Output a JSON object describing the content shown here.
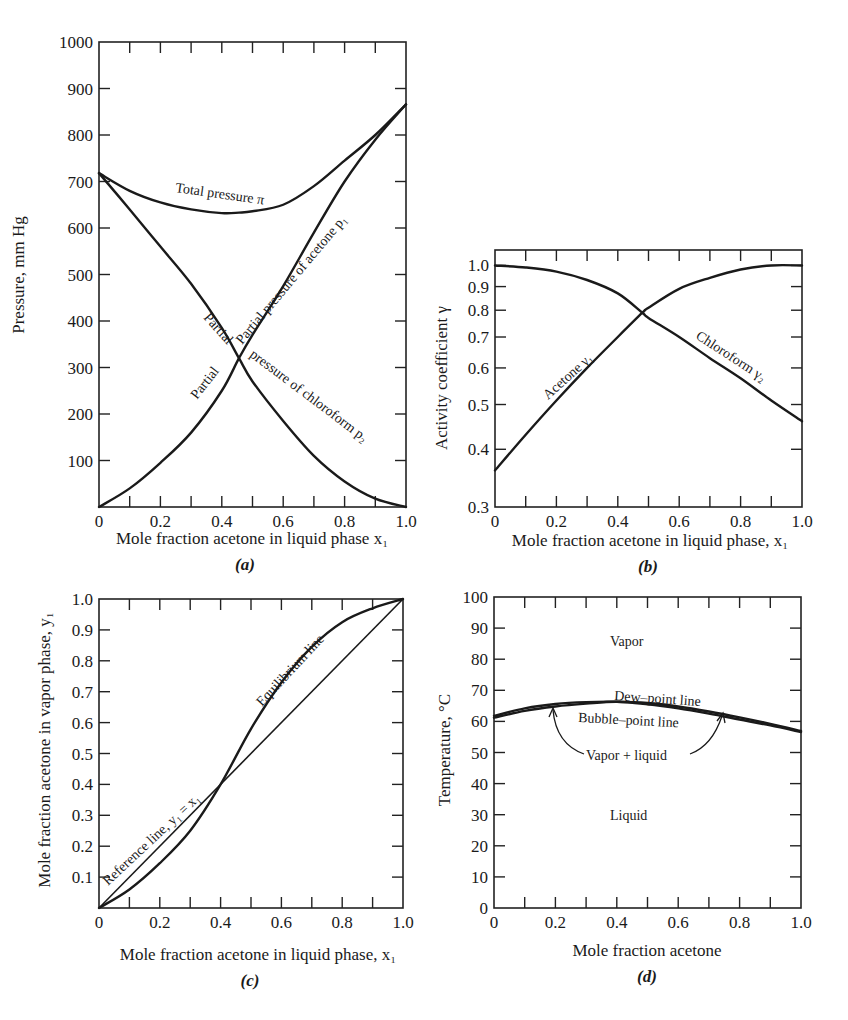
{
  "chart_data": [
    {
      "panel": "(a)",
      "type": "line",
      "title": "",
      "xlabel": "Mole fraction acetone in liquid phase x1",
      "ylabel": "Pressure, mm Hg",
      "xlim": [
        0,
        1.0
      ],
      "ylim": [
        0,
        1000
      ],
      "xticks": [
        "0",
        "0.2",
        "0.4",
        "0.6",
        "0.8",
        "1.0"
      ],
      "yticks": [
        "100",
        "200",
        "300",
        "400",
        "500",
        "600",
        "700",
        "800",
        "900",
        "1000"
      ],
      "grid": false,
      "x": [
        0,
        0.1,
        0.2,
        0.3,
        0.4,
        0.456,
        0.5,
        0.6,
        0.7,
        0.8,
        0.9,
        1.0
      ],
      "series": [
        {
          "name": "Total pressure π",
          "values": [
            718,
            680,
            655,
            640,
            632,
            633,
            636,
            650,
            690,
            745,
            800,
            866
          ]
        },
        {
          "name": "Partial pressure of acetone p1",
          "values": [
            0,
            40,
            95,
            160,
            250,
            320,
            370,
            475,
            590,
            700,
            790,
            866
          ]
        },
        {
          "name": "Partial pressure of chloroform p2",
          "values": [
            718,
            640,
            560,
            480,
            385,
            320,
            270,
            185,
            110,
            55,
            18,
            0
          ]
        }
      ],
      "annotations": [
        "Total pressure π",
        "Partial pressure of acetone p1",
        "Partial pressure of chloroform p2"
      ]
    },
    {
      "panel": "(b)",
      "type": "line",
      "title": "",
      "xlabel": "Mole fraction acetone in liquid phase, x1",
      "ylabel": "Activity coefficient γ",
      "xlim": [
        0,
        1.0
      ],
      "ylim": [
        0.3,
        1.08
      ],
      "yscale": "log",
      "xticks": [
        "0",
        "0.2",
        "0.4",
        "0.6",
        "0.8",
        "1.0"
      ],
      "yticks": [
        "0.3",
        "0.4",
        "0.5",
        "0.6",
        "0.7",
        "0.8",
        "0.9",
        "1.0"
      ],
      "grid": false,
      "x": [
        0,
        0.1,
        0.2,
        0.3,
        0.4,
        0.48,
        0.5,
        0.6,
        0.7,
        0.8,
        0.9,
        1.0
      ],
      "series": [
        {
          "name": "Acetone γ1",
          "values": [
            0.36,
            0.43,
            0.51,
            0.6,
            0.7,
            0.79,
            0.81,
            0.89,
            0.94,
            0.98,
            1.0,
            1.0
          ]
        },
        {
          "name": "Chloroform γ2",
          "values": [
            1.0,
            0.99,
            0.97,
            0.93,
            0.87,
            0.79,
            0.77,
            0.7,
            0.63,
            0.57,
            0.51,
            0.46
          ]
        }
      ],
      "annotations": [
        "Acetone γ1",
        "Chloroform γ2"
      ]
    },
    {
      "panel": "(c)",
      "type": "line",
      "title": "",
      "xlabel": "Mole fraction acetone in liquid phase, x1",
      "ylabel": "Mole fraction acetone in vapor phase, y1",
      "xlim": [
        0,
        1.0
      ],
      "ylim": [
        0,
        1.0
      ],
      "xticks": [
        "0",
        "0.2",
        "0.4",
        "0.6",
        "0.8",
        "1.0"
      ],
      "yticks": [
        "0.1",
        "0.2",
        "0.3",
        "0.4",
        "0.5",
        "0.6",
        "0.7",
        "0.8",
        "0.9",
        "1.0"
      ],
      "grid": false,
      "x": [
        0,
        0.1,
        0.2,
        0.3,
        0.4,
        0.5,
        0.6,
        0.7,
        0.8,
        0.9,
        1.0
      ],
      "series": [
        {
          "name": "Reference line, y1 = x1",
          "values": [
            0,
            0.1,
            0.2,
            0.3,
            0.4,
            0.5,
            0.6,
            0.7,
            0.8,
            0.9,
            1.0
          ]
        },
        {
          "name": "Equilibrium line",
          "values": [
            0,
            0.06,
            0.145,
            0.25,
            0.4,
            0.58,
            0.73,
            0.845,
            0.925,
            0.97,
            1.0
          ]
        }
      ],
      "annotations": [
        "Reference line, y1 = x1",
        "Equilibrium line"
      ]
    },
    {
      "panel": "(d)",
      "type": "line",
      "title": "",
      "xlabel": "Mole fraction acetone",
      "ylabel": "Temperature, °C",
      "xlim": [
        0,
        1.0
      ],
      "ylim": [
        0,
        100
      ],
      "xticks": [
        "0",
        "0.2",
        "0.4",
        "0.6",
        "0.8",
        "1.0"
      ],
      "yticks": [
        "0",
        "10",
        "20",
        "30",
        "40",
        "50",
        "60",
        "70",
        "80",
        "90",
        "100"
      ],
      "grid": false,
      "x": [
        0,
        0.1,
        0.2,
        0.3,
        0.4,
        0.5,
        0.6,
        0.7,
        0.8,
        0.9,
        1.0
      ],
      "series": [
        {
          "name": "Dew-point line",
          "values": [
            61.8,
            64.2,
            65.6,
            66.2,
            66.3,
            65.9,
            64.8,
            63.2,
            61.3,
            59.2,
            56.9
          ]
        },
        {
          "name": "Bubble-point line",
          "values": [
            61.2,
            63.4,
            64.8,
            65.7,
            66.3,
            65.5,
            64.2,
            62.5,
            60.6,
            58.7,
            56.6
          ]
        }
      ],
      "annotations": [
        "Vapor",
        "Dew-point line",
        "Bubble-point line",
        "Vapor + liquid",
        "Liquid"
      ]
    }
  ],
  "panels": {
    "a": {
      "label": "(a)",
      "ylabel": "Pressure, mm Hg",
      "xlabel": "Mole fraction acetone in liquid phase x₁",
      "ann_total": "Total pressure π",
      "ann_acetone": "Partial pressure of acetone p₁",
      "ann_partial1": "Partial",
      "ann_pressure_chloro": "pressure of chloroform p₂"
    },
    "b": {
      "label": "(b)",
      "ylabel": "Activity coefficient γ",
      "xlabel": "Mole fraction acetone in liquid phase, x₁",
      "ann_acetone": "Acetone γ₁",
      "ann_chloro": "Chloroform γ₂"
    },
    "c": {
      "label": "(c)",
      "ylabel": "Mole fraction acetone in vapor phase, y₁",
      "xlabel": "Mole fraction acetone in liquid phase, x₁",
      "ann_ref": "Reference line, y₁ = x₁",
      "ann_eq": "Equilibrium line"
    },
    "d": {
      "label": "(d)",
      "ylabel": "Temperature, °C",
      "xlabel": "Mole fraction acetone",
      "ann_vapor": "Vapor",
      "ann_dew": "Dew–point line",
      "ann_bubble": "Bubble–point line",
      "ann_vl": "Vapor + liquid",
      "ann_liquid": "Liquid"
    }
  }
}
